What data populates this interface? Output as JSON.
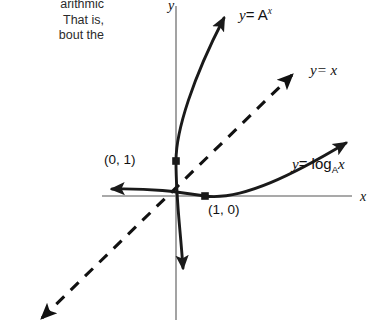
{
  "figure": {
    "background_color": "#ffffff",
    "axis_color": "#8c8c8c",
    "curve_color": "#1a1a1a",
    "dashed_color": "#111111",
    "text_color": "#1a1a1a"
  },
  "body_text": {
    "line1": "arithmic",
    "line2": "That is,",
    "line3": "bout the"
  },
  "axes": {
    "x_label": "x",
    "y_label": "y",
    "origin_x": 176,
    "origin_y": 196
  },
  "curves": [
    {
      "name": "exponential",
      "label_y": "y",
      "label_eq": "= A",
      "label_exponent": "x",
      "label_full": "y = A^x",
      "style": "solid",
      "arrow_ends": [
        "top",
        "bottom"
      ]
    },
    {
      "name": "identity",
      "label_y": "y",
      "label_eq": "= x",
      "label_full": "y = x",
      "style": "dashed",
      "arrow_ends": [
        "top-right",
        "bottom-left"
      ]
    },
    {
      "name": "logarithmic",
      "label_y": "y",
      "label_eq": "= log",
      "label_base": "A",
      "label_arg": "x",
      "label_full": "y = log_A x",
      "style": "solid",
      "arrow_ends": [
        "right",
        "left"
      ]
    }
  ],
  "points": [
    {
      "name": "y-intercept",
      "label": "(0, 1)",
      "x": 0,
      "y": 1,
      "px": 176,
      "py": 161
    },
    {
      "name": "x-intercept",
      "label": "(1, 0)",
      "x": 1,
      "y": 0,
      "px": 205,
      "py": 196
    }
  ]
}
